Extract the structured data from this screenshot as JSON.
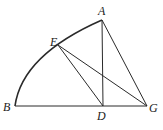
{
  "diagram": {
    "type": "geometry",
    "points": {
      "A": {
        "label": "A"
      },
      "B": {
        "label": "B"
      },
      "D": {
        "label": "D"
      },
      "E": {
        "label": "E"
      },
      "G": {
        "label": "G"
      }
    },
    "segments": [
      [
        "A",
        "D"
      ],
      [
        "A",
        "G"
      ],
      [
        "B",
        "G"
      ],
      [
        "E",
        "D"
      ],
      [
        "E",
        "G"
      ]
    ],
    "arcs": [
      {
        "from": "B",
        "to": "A",
        "through": "E"
      }
    ],
    "colors": {
      "stroke": "#2a2a2a",
      "label": "#222222"
    }
  }
}
